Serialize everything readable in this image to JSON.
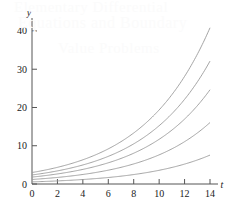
{
  "figure": {
    "name": "exponential-growth-curves",
    "background_color": "#ffffff",
    "curve_color": "#9a9a9a",
    "axis_color": "#555555",
    "text_color": "#1a1a1a"
  },
  "watermark": {
    "color": "#fbfbfb",
    "line1": "Elementary Differential",
    "line2": "Equations and Boundary",
    "line3": "Value Problems"
  },
  "chart_data": {
    "type": "line",
    "title": "",
    "subtitle": "",
    "xlabel": "t",
    "ylabel": "y",
    "xlim": [
      0,
      14
    ],
    "ylim": [
      0,
      42
    ],
    "grid": false,
    "legend": "none",
    "xticks": [
      0,
      2,
      4,
      6,
      8,
      10,
      12,
      14
    ],
    "xtick_labels": [
      "0",
      "2",
      "4",
      "6",
      "8",
      "10",
      "12",
      "14"
    ],
    "yticks": [
      0,
      10,
      20,
      30,
      40
    ],
    "ytick_labels": [
      "0",
      "10",
      "20",
      "30",
      "40"
    ],
    "x": [
      0,
      1,
      2,
      3,
      4,
      5,
      6,
      7,
      8,
      9,
      10,
      11,
      12,
      13,
      14
    ],
    "series": [
      {
        "name": "curve-1",
        "y0": 3.0,
        "rate": 0.1865,
        "values": [
          3.0,
          3.62,
          4.36,
          5.25,
          6.32,
          7.62,
          9.18,
          11.06,
          13.32,
          16.05,
          19.33,
          23.29,
          28.05,
          33.79,
          40.7
        ]
      },
      {
        "name": "curve-2",
        "y0": 2.36,
        "rate": 0.1865,
        "values": [
          2.36,
          2.84,
          3.43,
          4.13,
          4.97,
          5.99,
          7.22,
          8.7,
          10.48,
          12.62,
          15.21,
          18.32,
          22.07,
          26.58,
          32.02
        ]
      },
      {
        "name": "curve-3",
        "y0": 1.81,
        "rate": 0.1865,
        "values": [
          1.81,
          2.18,
          2.63,
          3.17,
          3.81,
          4.59,
          5.54,
          6.67,
          8.04,
          9.68,
          11.66,
          14.05,
          16.93,
          20.39,
          24.56
        ]
      },
      {
        "name": "curve-4",
        "y0": 1.18,
        "rate": 0.1865,
        "values": [
          1.18,
          1.42,
          1.71,
          2.07,
          2.49,
          3.0,
          3.61,
          4.35,
          5.24,
          6.31,
          7.6,
          9.16,
          11.04,
          13.29,
          16.01
        ]
      },
      {
        "name": "curve-5",
        "y0": 0.555,
        "rate": 0.1865,
        "values": [
          0.56,
          0.67,
          0.81,
          0.97,
          1.17,
          1.41,
          1.7,
          2.05,
          2.47,
          2.97,
          3.58,
          4.31,
          5.19,
          6.25,
          7.53
        ]
      }
    ]
  }
}
